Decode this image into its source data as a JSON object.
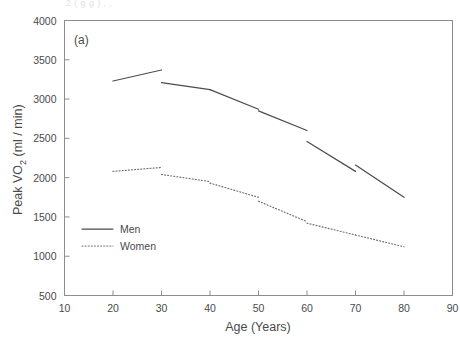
{
  "figure": {
    "panel_label": "(a)",
    "cut_caption_top": "2 ( g g ) , ,"
  },
  "chart_data": {
    "type": "line",
    "title": "",
    "xlabel": "Age (Years)",
    "ylabel": "Peak VO2 (ml / min)",
    "ylabel_parts": {
      "before": "Peak VO",
      "sub": "2",
      "after": " (ml / min)"
    },
    "xlim": [
      10,
      90
    ],
    "ylim": [
      500,
      4000
    ],
    "xticks": [
      10,
      20,
      30,
      40,
      50,
      60,
      70,
      80,
      90
    ],
    "yticks": [
      500,
      1000,
      1500,
      2000,
      2500,
      3000,
      3500,
      4000
    ],
    "xtick_labels": [
      "10",
      "20",
      "30",
      "40",
      "50",
      "60",
      "70",
      "80",
      "90"
    ],
    "ytick_labels": [
      "500",
      "1000",
      "1500",
      "2000",
      "2500",
      "3000",
      "3500",
      "4000"
    ],
    "grid": false,
    "legend_position": "lower-left-inside",
    "note": "Each series is drawn as five disconnected decade segments (age-group regression lines) with visible gaps at the decade boundaries.",
    "series": [
      {
        "name": "Men",
        "style": "solid",
        "color": "#4c4c4c",
        "segments": [
          {
            "age_range": [
              20,
              30
            ],
            "x": [
              20,
              30
            ],
            "y": [
              3230,
              3370
            ]
          },
          {
            "age_range": [
              30,
              40
            ],
            "x": [
              30,
              40
            ],
            "y": [
              3210,
              3120
            ]
          },
          {
            "age_range": [
              40,
              50
            ],
            "x": [
              40,
              50
            ],
            "y": [
              3120,
              2870
            ]
          },
          {
            "age_range": [
              50,
              60
            ],
            "x": [
              50,
              60
            ],
            "y": [
              2850,
              2600
            ]
          },
          {
            "age_range": [
              60,
              70
            ],
            "x": [
              60,
              70
            ],
            "y": [
              2460,
              2080
            ]
          },
          {
            "age_range": [
              70,
              80
            ],
            "x": [
              70,
              80
            ],
            "y": [
              2160,
              1750
            ]
          }
        ]
      },
      {
        "name": "Women",
        "style": "dotted",
        "color": "#6e6e6e",
        "segments": [
          {
            "age_range": [
              20,
              30
            ],
            "x": [
              20,
              30
            ],
            "y": [
              2080,
              2130
            ]
          },
          {
            "age_range": [
              30,
              40
            ],
            "x": [
              30,
              40
            ],
            "y": [
              2040,
              1950
            ]
          },
          {
            "age_range": [
              40,
              50
            ],
            "x": [
              40,
              50
            ],
            "y": [
              1930,
              1750
            ]
          },
          {
            "age_range": [
              50,
              60
            ],
            "x": [
              50,
              60
            ],
            "y": [
              1700,
              1440
            ]
          },
          {
            "age_range": [
              60,
              70
            ],
            "x": [
              60,
              70
            ],
            "y": [
              1420,
              1270
            ]
          },
          {
            "age_range": [
              70,
              80
            ],
            "x": [
              70,
              80
            ],
            "y": [
              1270,
              1120
            ]
          }
        ]
      }
    ],
    "legend": [
      {
        "label": "Men",
        "style": "solid"
      },
      {
        "label": "Women",
        "style": "dotted"
      }
    ]
  }
}
